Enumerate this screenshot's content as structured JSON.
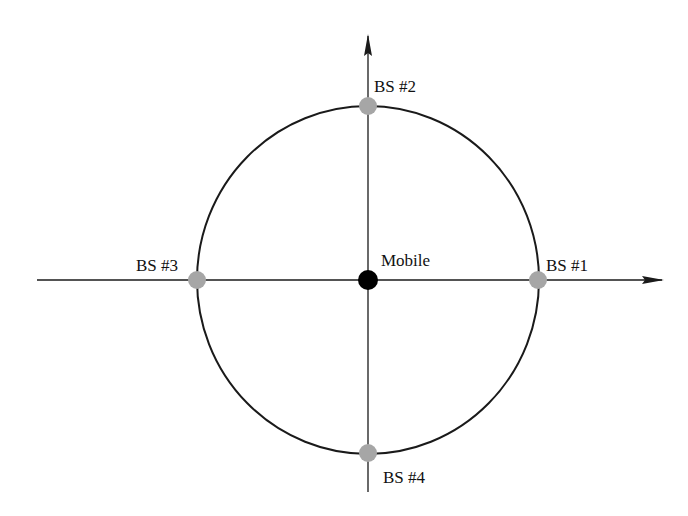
{
  "diagram": {
    "type": "geometry",
    "colors": {
      "axis": "#1a1a1a",
      "circle": "#1a1a1a",
      "base_station": "#a6a6a6",
      "mobile": "#000000",
      "text": "#111111"
    },
    "mobile": {
      "label": "Mobile"
    },
    "base_stations": [
      {
        "id": 1,
        "label": "BS #1"
      },
      {
        "id": 2,
        "label": "BS #2"
      },
      {
        "id": 3,
        "label": "BS #3"
      },
      {
        "id": 4,
        "label": "BS #4"
      }
    ]
  }
}
